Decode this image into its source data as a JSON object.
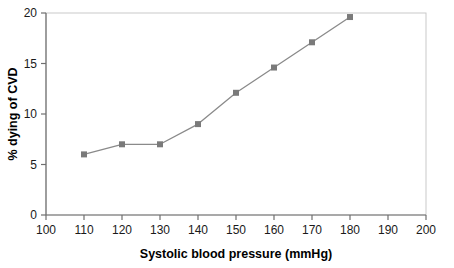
{
  "chart_data": {
    "type": "line",
    "title": "",
    "xlabel": "Systolic blood pressure (mmHg)",
    "ylabel": "% dying of CVD",
    "x": [
      110,
      120,
      130,
      140,
      150,
      160,
      170,
      180
    ],
    "values": [
      6.0,
      7.0,
      7.0,
      9.0,
      12.1,
      14.6,
      17.1,
      19.6
    ],
    "series": [
      {
        "name": "% dying of CVD",
        "values": [
          6.0,
          7.0,
          7.0,
          9.0,
          12.1,
          14.6,
          17.1,
          19.6
        ]
      }
    ],
    "xlim": [
      100,
      200
    ],
    "ylim": [
      0,
      20
    ],
    "xticks": [
      100,
      110,
      120,
      130,
      140,
      150,
      160,
      170,
      180,
      190,
      200
    ],
    "xtick_labels": [
      "100",
      "110",
      "120",
      "130",
      "140",
      "150",
      "160",
      "170",
      "180",
      "190",
      "200"
    ],
    "yticks": [
      0,
      5,
      10,
      15,
      20
    ],
    "ytick_labels": [
      "0",
      "5",
      "10",
      "15",
      "20"
    ],
    "grid": false,
    "legend": "none",
    "marker": "square",
    "line_color": "#8a8a8a",
    "marker_color": "#7a7a7a",
    "axis_color": "#6f6f6f",
    "frame_color": "#c9c9c9",
    "background_color": "#ffffff",
    "text_color": "#1a1a1a"
  }
}
